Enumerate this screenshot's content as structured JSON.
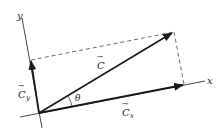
{
  "diagram": {
    "colors": {
      "line": "#1a1a1a",
      "dashed": "#444444",
      "text": "#222222",
      "background": "#ffffff"
    },
    "axes": {
      "x": {
        "label": "x"
      },
      "y": {
        "label": "y"
      }
    },
    "vectors": [
      {
        "id": "C",
        "label": "C",
        "arrow": "→"
      },
      {
        "id": "Cx",
        "label": "C",
        "subscript": "x",
        "arrow": "→"
      },
      {
        "id": "Cy",
        "label": "C",
        "subscript": "y",
        "arrow": "→"
      }
    ],
    "angle": {
      "label": "θ"
    }
  }
}
